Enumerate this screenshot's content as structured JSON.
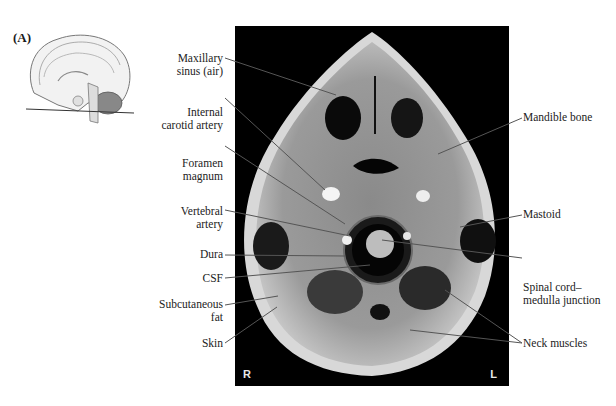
{
  "figure": {
    "panel_label": "(A)",
    "inset_description": "Sagittal brain sketch with horizontal plane line",
    "side_markers": {
      "right": "R",
      "left": "L"
    },
    "labels_left": [
      {
        "id": "maxillary-sinus",
        "line1": "Maxillary",
        "line2": "sinus (air)"
      },
      {
        "id": "internal-carotid",
        "line1": "Internal",
        "line2": "carotid artery"
      },
      {
        "id": "foramen-magnum",
        "line1": "Foramen",
        "line2": "magnum"
      },
      {
        "id": "vertebral-artery",
        "line1": "Vertebral",
        "line2": "artery"
      },
      {
        "id": "dura",
        "line1": "Dura",
        "line2": ""
      },
      {
        "id": "csf",
        "line1": "CSF",
        "line2": ""
      },
      {
        "id": "subcutaneous-fat",
        "line1": "Subcutaneous",
        "line2": "fat"
      },
      {
        "id": "skin",
        "line1": "Skin",
        "line2": ""
      }
    ],
    "labels_right": [
      {
        "id": "mandible",
        "line1": "Mandible bone",
        "line2": ""
      },
      {
        "id": "mastoid",
        "line1": "Mastoid",
        "line2": ""
      },
      {
        "id": "spinal-cord",
        "line1": "Spinal cord–",
        "line2": "medulla junction"
      },
      {
        "id": "neck-muscles",
        "line1": "Neck muscles",
        "line2": ""
      }
    ],
    "colors": {
      "leader_line": "#555555",
      "mri_background": "#000000"
    }
  }
}
